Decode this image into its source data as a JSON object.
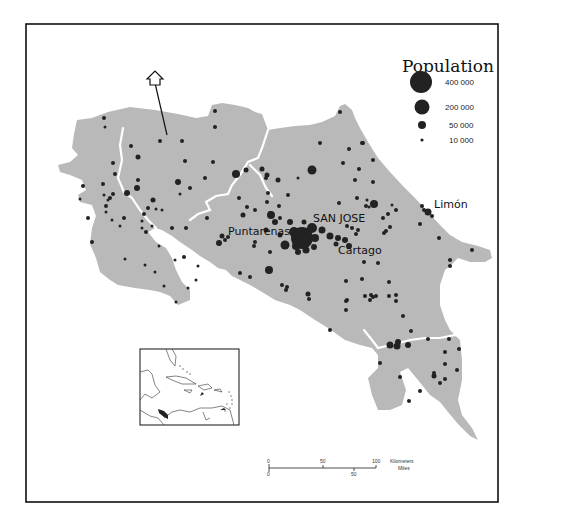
{
  "legend": {
    "title": "Population",
    "items": [
      {
        "label": "400 000",
        "r": 11
      },
      {
        "label": "200 000",
        "r": 7.5
      },
      {
        "label": "50 000",
        "r": 4
      },
      {
        "label": "10 000",
        "r": 1.6
      }
    ]
  },
  "cities": [
    {
      "name": "SAN JOSE"
    },
    {
      "name": "Puntarenas"
    },
    {
      "name": "Cartago"
    },
    {
      "name": "Limón"
    }
  ],
  "scale_bar": {
    "km_ticks": [
      "0",
      "50",
      "100"
    ],
    "km_unit": "Kilometers",
    "mi_ticks": [
      "0",
      "50"
    ],
    "mi_unit": "Miles"
  },
  "north_arrow": {
    "icon": "north-arrow-icon"
  },
  "colors": {
    "land": "#b9b9b9",
    "dot": "#222222",
    "frame": "#111111",
    "river": "#ffffff"
  }
}
